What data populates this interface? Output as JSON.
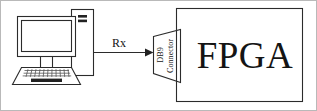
{
  "diagram": {
    "type": "block-diagram",
    "background_color": "#ffffff",
    "line_color": "#2b2b2b",
    "text_color": "#141414",
    "nodes": [
      {
        "id": "pc",
        "name": "computer",
        "label": "",
        "icon": "desktop-computer-icon",
        "description": "Desktop computer: monitor with stand, keyboard, and tower case"
      },
      {
        "id": "db9",
        "name": "db9-connector",
        "label_line1": "DB9",
        "label_line2": "Connector",
        "shape": "trapezoid",
        "text_orientation": "vertical-bottom-to-top"
      },
      {
        "id": "fpga",
        "name": "fpga-block",
        "label": "FPGA",
        "shape": "rectangle"
      }
    ],
    "edges": [
      {
        "id": "rx-link",
        "name": "rx-signal-arrow",
        "label": "Rx",
        "from": "pc",
        "to": "db9",
        "arrow": "single-headed-right"
      }
    ]
  }
}
